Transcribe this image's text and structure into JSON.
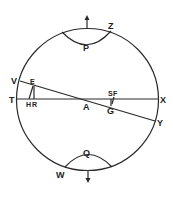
{
  "diagram": {
    "type": "geometric-celestial-sphere",
    "stroke_color": "#2a2a2a",
    "background": "#ffffff",
    "circle": {
      "cx": 87.5,
      "cy": 99.5,
      "r": 71
    },
    "labels": {
      "Z": "Z",
      "P": "P",
      "V": "V",
      "E": "E",
      "T": "T",
      "H": "H",
      "R": "R",
      "A": "A",
      "S": "S",
      "F": "F",
      "G": "G",
      "X": "X",
      "Y": "Y",
      "Q": "Q",
      "W": "W"
    },
    "arrows": [
      {
        "name": "north-arrow",
        "direction": "up"
      },
      {
        "name": "south-arrow",
        "direction": "down"
      }
    ],
    "lines": [
      {
        "name": "horizontal-line-TX",
        "from": "T",
        "to": "X"
      },
      {
        "name": "inclined-line-VY",
        "from": "V",
        "to": "Y"
      },
      {
        "name": "vertical-line-EH",
        "from": "E",
        "to": "H"
      },
      {
        "name": "segment-SG",
        "from": "S",
        "to": "G"
      }
    ],
    "arcs": [
      {
        "name": "upper-arc-P",
        "through": "P"
      },
      {
        "name": "lower-arc-Q",
        "through": "Q"
      }
    ]
  }
}
